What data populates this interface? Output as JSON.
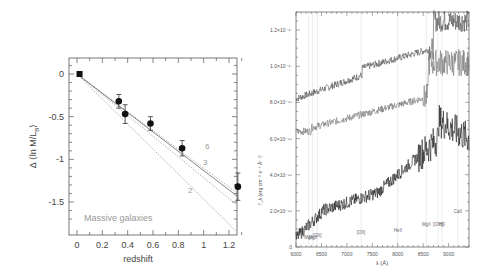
{
  "chart_data": [
    {
      "type": "scatter",
      "title": "",
      "xlabel": "redshift",
      "ylabel": "Δ⟨ln M/L_B⟩",
      "xlim": [
        -0.05,
        1.38
      ],
      "ylim": [
        -1.88,
        0.2
      ],
      "x_ticks": [
        "0",
        "0.2",
        "0.4",
        "0.6",
        "0.8",
        "1",
        "1.2"
      ],
      "y_ticks": [
        "0",
        "-0.5",
        "-1",
        "-1.5"
      ],
      "annotation": "Massive galaxies",
      "points": [
        {
          "x": 0.02,
          "y": 0.0,
          "err": 0.0,
          "marker": "square"
        },
        {
          "x": 0.33,
          "y": -0.32,
          "err": 0.08
        },
        {
          "x": 0.38,
          "y": -0.47,
          "err": 0.11
        },
        {
          "x": 0.58,
          "y": -0.58,
          "err": 0.08
        },
        {
          "x": 0.83,
          "y": -0.87,
          "err": 0.09
        },
        {
          "x": 1.27,
          "y": -1.32,
          "err": 0.16
        }
      ],
      "lines": [
        {
          "name": "fit",
          "style": "solid",
          "slope": -1.04
        },
        {
          "name": "6",
          "style": "dotted",
          "slope": -0.87
        },
        {
          "name": "3",
          "style": "dotted",
          "slope": -1.02
        },
        {
          "name": "2",
          "style": "dotted",
          "slope": -1.34
        }
      ],
      "line_labels": [
        "6",
        "3",
        "2"
      ]
    },
    {
      "type": "line",
      "title": "",
      "xlabel": "λ (Å)",
      "ylabel": "f_λ (erg cm⁻² s⁻¹ Å⁻¹)",
      "xlim": [
        6000,
        9400
      ],
      "ylim": [
        0,
        1.3e-17
      ],
      "x_ticks": [
        "6000",
        "6500",
        "7000",
        "7500",
        "8000",
        "8500",
        "9000"
      ],
      "y_ticks": [
        "0",
        "2.0×10⁻¹⁸",
        "4.0×10⁻¹⁸",
        "6.0×10⁻¹⁸",
        "8.0×10⁻¹⁸",
        "1.0×10⁻¹⁷",
        "1.2×10⁻¹⁷"
      ],
      "series": [
        {
          "name": "spectrum-top",
          "description": "upper spectrum, rising from ~8.2e-18 to ~1.25e-17"
        },
        {
          "name": "spectrum-middle",
          "description": "middle spectrum, ~6.5e-18 rising to ~1.05e-17"
        },
        {
          "name": "spectrum-bottom",
          "description": "lower noisy spectrum, ~0.5e-18 rising to ~7e-18"
        }
      ],
      "line_markers": [
        {
          "x": 6250,
          "label": "MgII"
        },
        {
          "x": 6330,
          "label": "MgII"
        },
        {
          "x": 6420,
          "label": "[OII]"
        },
        {
          "x": 7280,
          "label": "[OII]"
        },
        {
          "x": 8000,
          "label": "HeII"
        },
        {
          "x": 8560,
          "label": "MgII"
        },
        {
          "x": 8790,
          "label": "[OIII]"
        },
        {
          "x": 8870,
          "label": "Hβ"
        },
        {
          "x": 9180,
          "label": "CaII"
        }
      ]
    }
  ],
  "left_plot": {
    "xlabel": "redshift",
    "ylabel_prefix": "Δ ⟨ln M/L",
    "ylabel_sub": "B",
    "ylabel_suffix": "⟩",
    "annotation": "Massive galaxies",
    "x_ticks": [
      "0",
      "0.2",
      "0.4",
      "0.6",
      "0.8",
      "1",
      "1.2"
    ],
    "y_ticks": [
      "0",
      "-0.5",
      "-1",
      "-1.5"
    ],
    "line_labels": [
      "6",
      "3",
      "2"
    ]
  },
  "right_plot": {
    "xlabel": "λ (Å)",
    "ylabel": "f_λ (erg cm⁻² s⁻¹ Å⁻¹)",
    "x_ticks": [
      "6000",
      "6500",
      "7000",
      "7500",
      "8000",
      "8500",
      "9000"
    ],
    "y_ticks": [
      "0",
      "2.0×10⁻¹⁸",
      "4.0×10⁻¹⁸",
      "6.0×10⁻¹⁸",
      "8.0×10⁻¹⁸",
      "1.0×10⁻¹⁷",
      "1.2×10⁻¹⁷"
    ],
    "markers": [
      "MgII",
      "[OII]",
      "[OII]",
      "HeII",
      "MgII",
      "[OIII]",
      "CaII"
    ]
  }
}
